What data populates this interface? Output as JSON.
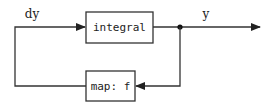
{
  "diagram": {
    "type": "block-diagram",
    "blocks": [
      {
        "id": "integral",
        "label": "integral"
      },
      {
        "id": "map",
        "label": "map: f"
      }
    ],
    "signals": [
      {
        "id": "dy",
        "label": "dy",
        "from": "map",
        "to": "integral"
      },
      {
        "id": "y",
        "label": "y",
        "from": "integral",
        "to": "output"
      },
      {
        "id": "feedback",
        "label": "",
        "from": "junction",
        "to": "map"
      }
    ],
    "colors": {
      "stroke": "#333333",
      "background": "#ffffff"
    }
  }
}
